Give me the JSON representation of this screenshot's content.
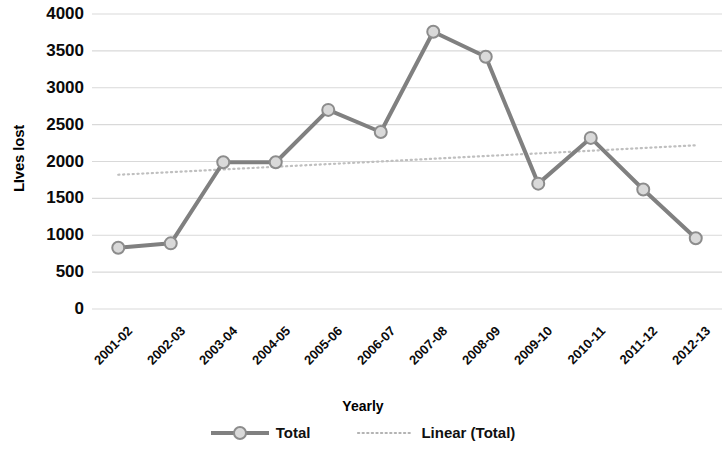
{
  "chart_data": {
    "type": "line",
    "title": "",
    "xlabel": "Yearly",
    "ylabel": "LIves lost",
    "categories": [
      "2001-02",
      "2002-03",
      "2003-04",
      "2004-05",
      "2005-06",
      "2006-07",
      "2007-08",
      "2008-09",
      "2009-10",
      "2010-11",
      "2011-12",
      "2012-13"
    ],
    "series": [
      {
        "name": "Total",
        "type": "line",
        "marker": "circle",
        "values": [
          830,
          890,
          1990,
          1990,
          2700,
          2400,
          3760,
          3420,
          1700,
          2320,
          1620,
          960
        ]
      },
      {
        "name": "Linear (Total)",
        "type": "trendline",
        "style": "dotted",
        "values": [
          1820,
          1856,
          1892,
          1928,
          1965,
          2001,
          2037,
          2074,
          2110,
          2146,
          2183,
          2220
        ],
        "start_value": 1820,
        "end_value": 2220
      }
    ],
    "ylim": [
      0,
      4000
    ],
    "ytick_step": 500,
    "yticks": [
      "4000",
      "3500",
      "3000",
      "2500",
      "2000",
      "1500",
      "1000",
      "500",
      "0"
    ],
    "grid": true,
    "grid_axis": "y",
    "legend_position": "bottom",
    "colors": {
      "series_line": "#808080",
      "marker_fill": "#d9d9d9",
      "marker_stroke": "#8c8c8c",
      "trendline": "#bfbfbf",
      "gridline": "#d9d9d9",
      "text": "#000000"
    }
  },
  "legend": {
    "items": [
      {
        "label": "Total",
        "kind": "line-marker"
      },
      {
        "label": "Linear (Total)",
        "kind": "dotted"
      }
    ]
  }
}
